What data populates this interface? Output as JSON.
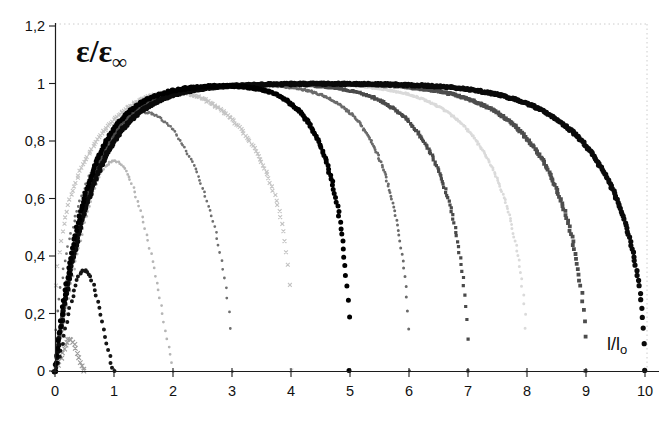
{
  "chart_data": {
    "type": "scatter",
    "title": "ε/ε∞",
    "title_main": "ε/ε",
    "title_sub": "∞",
    "xlabel": "l/lo",
    "xlabel_main": "l/l",
    "xlabel_sub": "o",
    "ylabel": "ε/ε∞",
    "xlim": [
      0,
      10.45
    ],
    "ylim": [
      0,
      1.2
    ],
    "grid": false,
    "legend": "none",
    "frame": "faint dotted top and right edges",
    "x_ticks": [
      {
        "v": 0,
        "label": "0"
      },
      {
        "v": 1,
        "label": "1"
      },
      {
        "v": 2,
        "label": "2"
      },
      {
        "v": 3,
        "label": "3"
      },
      {
        "v": 4,
        "label": "4"
      },
      {
        "v": 5,
        "label": "5"
      },
      {
        "v": 6,
        "label": "6"
      },
      {
        "v": 7,
        "label": "7"
      },
      {
        "v": 8,
        "label": "8"
      },
      {
        "v": 9,
        "label": "9"
      },
      {
        "v": 10,
        "label": "10"
      }
    ],
    "y_ticks": [
      {
        "v": 0,
        "label": "0"
      },
      {
        "v": 0.2,
        "label": "0,2"
      },
      {
        "v": 0.4,
        "label": "0,4"
      },
      {
        "v": 0.6,
        "label": "0,6"
      },
      {
        "v": 0.8,
        "label": "0,8"
      },
      {
        "v": 1,
        "label": "1"
      },
      {
        "v": 1.2,
        "label": "1,2"
      }
    ],
    "series": [
      {
        "name": "curve-end-0.5",
        "end": 0.5,
        "peak": 0.11,
        "model": "sin",
        "exp": 1.6,
        "marker": "cross",
        "color": "#9c9c9c",
        "size": 2.3,
        "step": 0.025
      },
      {
        "name": "curve-end-1",
        "end": 1,
        "peak": 0.35,
        "model": "sin",
        "exp": 1.35,
        "marker": "circle",
        "color": "#161616",
        "size": 2.0,
        "step": 0.025
      },
      {
        "name": "curve-end-2",
        "end": 2,
        "peak": 0.73,
        "model": "sin",
        "exp": 1.0,
        "marker": "circle",
        "color": "#b5b5b5",
        "size": 1.4,
        "step": 0.025
      },
      {
        "name": "curve-end-3",
        "end": 3,
        "peak": 0.9,
        "model": "sin",
        "exp": 0.5,
        "marker": "circle",
        "color": "#6f6f6f",
        "size": 1.4,
        "step": 0.025
      },
      {
        "name": "curve-end-4",
        "end": 4,
        "peak": 0.97,
        "model": "sin",
        "exp": 0.3,
        "marker": "cross",
        "color": "#c4c4c4",
        "size": 1.9,
        "step": 0.025
      },
      {
        "name": "curve-end-5",
        "end": 5,
        "peak": 1.0,
        "model": "sat",
        "alpha": 1.85,
        "marker": "circle",
        "color": "#000000",
        "size": 2.5,
        "step": 0.015
      },
      {
        "name": "curve-end-6",
        "end": 6,
        "peak": 1.0,
        "model": "sat",
        "alpha": 1.8,
        "marker": "circle",
        "color": "#6a6a6a",
        "size": 1.5,
        "step": 0.015
      },
      {
        "name": "curve-end-7",
        "end": 7,
        "peak": 1.0,
        "model": "sat",
        "alpha": 1.75,
        "marker": "square",
        "color": "#4a4a4a",
        "size": 1.6,
        "step": 0.015
      },
      {
        "name": "curve-end-8",
        "end": 8,
        "peak": 1.0,
        "model": "sat",
        "alpha": 1.7,
        "marker": "circle",
        "color": "#dadada",
        "size": 1.5,
        "step": 0.015
      },
      {
        "name": "curve-end-9",
        "end": 9,
        "peak": 1.0,
        "model": "sat",
        "alpha": 1.65,
        "marker": "square",
        "color": "#4d4d4d",
        "size": 1.9,
        "step": 0.015
      },
      {
        "name": "curve-end-10",
        "end": 10,
        "peak": 1.0,
        "model": "sat",
        "alpha": 1.6,
        "marker": "circle",
        "color": "#0a0a0a",
        "size": 2.6,
        "step": 0.015
      }
    ],
    "axis_color": "#1c1c1c",
    "frame_color": "#cccccc"
  }
}
